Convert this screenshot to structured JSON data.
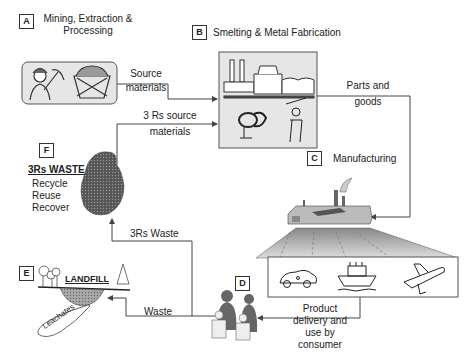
{
  "stages": {
    "A": {
      "letter": "A",
      "title_line1": "Mining, Extraction &",
      "title_line2": "Processing"
    },
    "B": {
      "letter": "B",
      "title": "Smelting & Metal Fabrication"
    },
    "C": {
      "letter": "C",
      "title": "Manufacturing"
    },
    "D": {
      "letter": "D"
    },
    "E": {
      "letter": "E",
      "title": "LANDFILL",
      "leachates": "Leachates"
    },
    "F": {
      "letter": "F",
      "title": "3Rs WASTE",
      "items": [
        "Recycle",
        "Reuse",
        "Recover"
      ]
    }
  },
  "flows": {
    "source_materials_1": "Source",
    "source_materials_2": "materials",
    "rs_source_1": "3 Rs source",
    "rs_source_2": "materials",
    "parts_1": "Parts and",
    "parts_2": "goods",
    "rs_waste": "3Rs Waste",
    "waste": "Waste",
    "product_1": "Product",
    "product_2": "delivery and",
    "product_3": "use by",
    "product_4": "consumer"
  },
  "colors": {
    "line": "#444444",
    "panel": "#e6e6e6",
    "waste_blob": "#555555",
    "people": "#666666"
  }
}
